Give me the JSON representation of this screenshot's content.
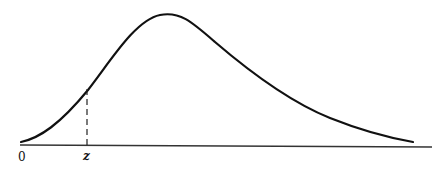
{
  "diagram": {
    "type": "skewed-distribution-curve",
    "labels": {
      "origin": "0",
      "z_marker": "z"
    },
    "colors": {
      "curve": "#111111",
      "axis": "#333333",
      "dashed": "#222222",
      "background": "#ffffff"
    }
  }
}
